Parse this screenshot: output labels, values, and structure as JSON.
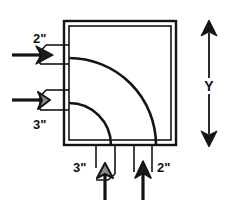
{
  "diagram": {
    "colors": {
      "stroke": "#141414",
      "fill_background": "#ffffff",
      "valve_fill_dark": "#1a1a1a",
      "valve_fill_gray": "#8c8c8c"
    },
    "vessel": {
      "name": "tank-body",
      "outer": {
        "x": 64,
        "y": 21,
        "width": 112,
        "height": 124
      },
      "inner": {
        "x": 69,
        "y": 26,
        "width": 102,
        "height": 114
      }
    },
    "inlets": [
      {
        "id": "inlet-top",
        "label": "2\"",
        "label_x": 33,
        "label_y": 43,
        "pipe_y_top": 45,
        "pipe_y_bottom": 64,
        "stem_y": 55,
        "valve_x": 42,
        "valve_fill": "dark"
      },
      {
        "id": "inlet-bottom",
        "label": "3\"",
        "label_x": 33,
        "label_y": 129,
        "pipe_y_top": 90,
        "pipe_y_bottom": 110,
        "stem_y": 100,
        "valve_x": 42,
        "valve_fill": "gray"
      }
    ],
    "outlets": [
      {
        "id": "outlet-left",
        "label": "3\"",
        "label_x": 73,
        "label_y": 172,
        "pipe_x_left": 96,
        "pipe_x_right": 115,
        "stem_x": 105,
        "valve_y": 167,
        "valve_fill": "gray"
      },
      {
        "id": "outlet-right",
        "label": "2\"",
        "label_x": 157,
        "label_y": 172,
        "pipe_x_left": 134,
        "pipe_x_right": 152,
        "stem_x": 143,
        "valve_y": 167,
        "valve_fill": "dark"
      }
    ],
    "arcs": [
      {
        "id": "arc-large",
        "start_x": 69,
        "start_y": 58,
        "radius": 87,
        "end_x": 156,
        "end_y": 145
      },
      {
        "id": "arc-small",
        "start_x": 69,
        "start_y": 103,
        "radius": 42,
        "end_x": 111,
        "end_y": 145
      }
    ],
    "dimension": {
      "id": "dimension-y",
      "label": "Y",
      "label_x": 209,
      "label_y": 88,
      "line_x": 209,
      "line_top": 22,
      "line_bottom": 145
    }
  }
}
